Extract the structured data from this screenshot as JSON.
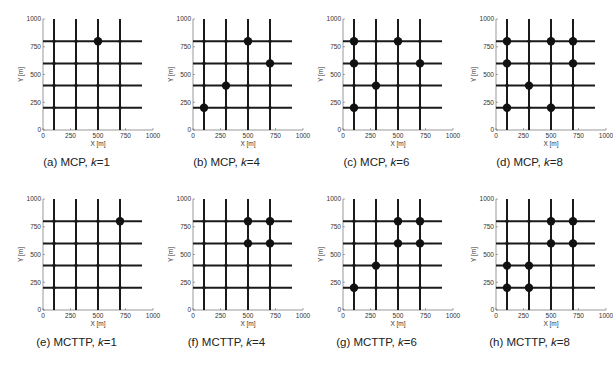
{
  "chart_data": [
    {
      "type": "scatter",
      "panel": "a",
      "caption_prefix": "(a) MCP, ",
      "k_label": "k",
      "k_value": "=1",
      "xlabel": "X [m]",
      "ylabel": "Y [m]",
      "xlim": [
        0,
        1000
      ],
      "ylim": [
        0,
        1000
      ],
      "xticks": [
        "0",
        "250",
        "500",
        "750",
        "1000"
      ],
      "yticks": [
        "0",
        "250",
        "500",
        "750",
        "1000"
      ],
      "grid_roads": {
        "vertical_x": [
          100,
          300,
          500,
          700
        ],
        "horizontal_y": [
          200,
          400,
          600,
          800
        ]
      },
      "points": [
        [
          500,
          800
        ]
      ]
    },
    {
      "type": "scatter",
      "panel": "b",
      "caption_prefix": "(b) MCP, ",
      "k_label": "k",
      "k_value": "=4",
      "xlabel": "X [m]",
      "ylabel": "Y [m]",
      "xlim": [
        0,
        1000
      ],
      "ylim": [
        0,
        1000
      ],
      "xticks": [
        "0",
        "250",
        "500",
        "750",
        "1000"
      ],
      "yticks": [
        "0",
        "250",
        "500",
        "750",
        "1000"
      ],
      "grid_roads": {
        "vertical_x": [
          100,
          300,
          500,
          700
        ],
        "horizontal_y": [
          200,
          400,
          600,
          800
        ]
      },
      "points": [
        [
          500,
          800
        ],
        [
          700,
          600
        ],
        [
          300,
          400
        ],
        [
          100,
          200
        ]
      ]
    },
    {
      "type": "scatter",
      "panel": "c",
      "caption_prefix": "(c) MCP, ",
      "k_label": "k",
      "k_value": "=6",
      "xlabel": "X [m]",
      "ylabel": "Y [m]",
      "xlim": [
        0,
        1000
      ],
      "ylim": [
        0,
        1000
      ],
      "xticks": [
        "0",
        "250",
        "500",
        "750",
        "1000"
      ],
      "yticks": [
        "0",
        "250",
        "500",
        "750",
        "1000"
      ],
      "grid_roads": {
        "vertical_x": [
          100,
          300,
          500,
          700
        ],
        "horizontal_y": [
          200,
          400,
          600,
          800
        ]
      },
      "points": [
        [
          100,
          800
        ],
        [
          500,
          800
        ],
        [
          100,
          600
        ],
        [
          700,
          600
        ],
        [
          300,
          400
        ],
        [
          100,
          200
        ]
      ]
    },
    {
      "type": "scatter",
      "panel": "d",
      "caption_prefix": "(d) MCP, ",
      "k_label": "k",
      "k_value": "=8",
      "xlabel": "X [m]",
      "ylabel": "Y [m]",
      "xlim": [
        0,
        1000
      ],
      "ylim": [
        0,
        1000
      ],
      "xticks": [
        "0",
        "250",
        "500",
        "750",
        "1000"
      ],
      "yticks": [
        "0",
        "250",
        "500",
        "750",
        "1000"
      ],
      "grid_roads": {
        "vertical_x": [
          100,
          300,
          500,
          700
        ],
        "horizontal_y": [
          200,
          400,
          600,
          800
        ]
      },
      "points": [
        [
          100,
          800
        ],
        [
          500,
          800
        ],
        [
          700,
          800
        ],
        [
          100,
          600
        ],
        [
          700,
          600
        ],
        [
          300,
          400
        ],
        [
          100,
          200
        ],
        [
          500,
          200
        ]
      ]
    },
    {
      "type": "scatter",
      "panel": "e",
      "caption_prefix": "(e) MCTTP, ",
      "k_label": "k",
      "k_value": "=1",
      "xlabel": "X [m]",
      "ylabel": "Y [m]",
      "xlim": [
        0,
        1000
      ],
      "ylim": [
        0,
        1000
      ],
      "xticks": [
        "0",
        "250",
        "500",
        "750",
        "1000"
      ],
      "yticks": [
        "0",
        "250",
        "500",
        "750",
        "1000"
      ],
      "grid_roads": {
        "vertical_x": [
          100,
          300,
          500,
          700
        ],
        "horizontal_y": [
          200,
          400,
          600,
          800
        ]
      },
      "points": [
        [
          700,
          800
        ]
      ]
    },
    {
      "type": "scatter",
      "panel": "f",
      "caption_prefix": "(f) MCTTP, ",
      "k_label": "k",
      "k_value": "=4",
      "xlabel": "X [m]",
      "ylabel": "Y [m]",
      "xlim": [
        0,
        1000
      ],
      "ylim": [
        0,
        1000
      ],
      "xticks": [
        "0",
        "250",
        "500",
        "750",
        "1000"
      ],
      "yticks": [
        "0",
        "250",
        "500",
        "750",
        "1000"
      ],
      "grid_roads": {
        "vertical_x": [
          100,
          300,
          500,
          700
        ],
        "horizontal_y": [
          200,
          400,
          600,
          800
        ]
      },
      "points": [
        [
          500,
          800
        ],
        [
          700,
          800
        ],
        [
          500,
          600
        ],
        [
          700,
          600
        ]
      ]
    },
    {
      "type": "scatter",
      "panel": "g",
      "caption_prefix": "(g) MCTTP, ",
      "k_label": "k",
      "k_value": "=6",
      "xlabel": "X [m]",
      "ylabel": "Y [m]",
      "xlim": [
        0,
        1000
      ],
      "ylim": [
        0,
        1000
      ],
      "xticks": [
        "0",
        "250",
        "500",
        "750",
        "1000"
      ],
      "yticks": [
        "0",
        "250",
        "500",
        "750",
        "1000"
      ],
      "grid_roads": {
        "vertical_x": [
          100,
          300,
          500,
          700
        ],
        "horizontal_y": [
          200,
          400,
          600,
          800
        ]
      },
      "points": [
        [
          500,
          800
        ],
        [
          700,
          800
        ],
        [
          500,
          600
        ],
        [
          700,
          600
        ],
        [
          300,
          400
        ],
        [
          100,
          200
        ]
      ]
    },
    {
      "type": "scatter",
      "panel": "h",
      "caption_prefix": "(h) MCTTP, ",
      "k_label": "k",
      "k_value": "=8",
      "xlabel": "X [m]",
      "ylabel": "Y [m]",
      "xlim": [
        0,
        1000
      ],
      "ylim": [
        0,
        1000
      ],
      "xticks": [
        "0",
        "250",
        "500",
        "750",
        "1000"
      ],
      "yticks": [
        "0",
        "250",
        "500",
        "750",
        "1000"
      ],
      "grid_roads": {
        "vertical_x": [
          100,
          300,
          500,
          700
        ],
        "horizontal_y": [
          200,
          400,
          600,
          800
        ]
      },
      "points": [
        [
          500,
          800
        ],
        [
          700,
          800
        ],
        [
          500,
          600
        ],
        [
          700,
          600
        ],
        [
          100,
          400
        ],
        [
          300,
          400
        ],
        [
          100,
          200
        ],
        [
          300,
          200
        ]
      ]
    }
  ],
  "style": {
    "road_color": "#1a1a1a",
    "marker_color": "#111111",
    "axis_color": "#555555"
  }
}
